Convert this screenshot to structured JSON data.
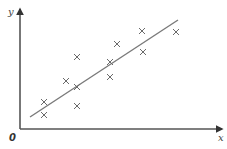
{
  "chart_data": {
    "type": "scatter",
    "title": "",
    "xlabel": "x",
    "ylabel": "y",
    "origin_label": "0",
    "grid": false,
    "legend": null,
    "marker": "x",
    "axis_ranges_px": {
      "x": [
        20,
        222
      ],
      "y": [
        129,
        10
      ]
    },
    "points": [
      {
        "x": 44,
        "y": 102
      },
      {
        "x": 44,
        "y": 115
      },
      {
        "x": 66,
        "y": 81
      },
      {
        "x": 77,
        "y": 57
      },
      {
        "x": 77,
        "y": 87
      },
      {
        "x": 77,
        "y": 106
      },
      {
        "x": 110,
        "y": 62
      },
      {
        "x": 110,
        "y": 77
      },
      {
        "x": 117,
        "y": 44
      },
      {
        "x": 142,
        "y": 31
      },
      {
        "x": 143,
        "y": 52
      },
      {
        "x": 176,
        "y": 32
      }
    ],
    "trend_line": {
      "x1": 30,
      "y1": 117,
      "x2": 178,
      "y2": 20
    },
    "note": "Values given in pixel coordinates (no numeric tick labels shown); points show positive correlation with line of best fit."
  },
  "colors": {
    "axis": "#555555",
    "trend": "#7a7a7a",
    "marker": "#6a6a6a"
  }
}
